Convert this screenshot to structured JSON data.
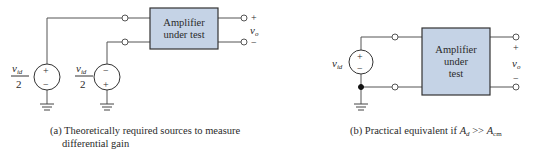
{
  "colors": {
    "wire": "#555555",
    "box_fill": "#c5d3e6",
    "box_stroke": "#333333",
    "text": "#2a2a2a"
  },
  "diagram_a": {
    "amplifier_label_line1": "Amplifier",
    "amplifier_label_line2": "under test",
    "source1": {
      "numerator": "v",
      "subscript": "id",
      "denominator": "2",
      "top_sign": "+",
      "bottom_sign": "−"
    },
    "source2": {
      "numerator": "v",
      "subscript": "id",
      "denominator": "2",
      "top_sign": "−",
      "bottom_sign": "+"
    },
    "output": {
      "plus": "+",
      "minus": "−",
      "label": "v",
      "label_subscript": "o"
    },
    "caption_line1": "(a) Theoretically required sources to measure",
    "caption_line2": "differential gain"
  },
  "diagram_b": {
    "amplifier_label_line1": "Amplifier",
    "amplifier_label_line2": "under",
    "amplifier_label_line3": "test",
    "source": {
      "label": "v",
      "subscript": "id",
      "top_sign": "+",
      "bottom_sign": "−"
    },
    "output": {
      "plus": "+",
      "minus": "−",
      "label": "v",
      "label_subscript": "o"
    },
    "caption_prefix": "(b) Practical equivalent if ",
    "caption_Ad": "A",
    "caption_Ad_sub": "d",
    "caption_op": " >> ",
    "caption_Acm": "A",
    "caption_Acm_sub": "cm"
  }
}
